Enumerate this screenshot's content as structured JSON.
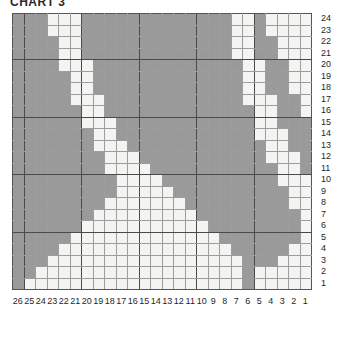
{
  "title": "CHART 3",
  "colors": {
    "filled": "#9a9a9a",
    "empty": "#f4f4f2",
    "grid_minor": "#9d9d9d",
    "grid_major": "#4a4a4a",
    "text": "#1f1f1f"
  },
  "chart_data": {
    "type": "heatmap",
    "title": "CHART 3",
    "xlabel": "",
    "ylabel": "",
    "legend": [],
    "grid": true,
    "columns": 26,
    "rows": 24,
    "column_labels": [
      26,
      25,
      24,
      23,
      22,
      21,
      20,
      19,
      18,
      17,
      16,
      15,
      14,
      13,
      12,
      11,
      10,
      9,
      8,
      7,
      6,
      5,
      4,
      3,
      2,
      1
    ],
    "row_labels": [
      24,
      23,
      22,
      21,
      20,
      19,
      18,
      17,
      16,
      15,
      14,
      13,
      12,
      11,
      10,
      9,
      8,
      7,
      6,
      5,
      4,
      3,
      2,
      1
    ],
    "value_meaning": {
      "1": "filled (contrast colour)",
      "0": "empty (background colour)"
    },
    "matrix_row_order": "top-to-bottom, row 24 first down to row 1",
    "matrix_column_order": "left-to-right, column 26 first down to column 1",
    "matrix": [
      [
        1,
        1,
        1,
        0,
        0,
        0,
        1,
        1,
        1,
        1,
        1,
        1,
        1,
        1,
        1,
        1,
        1,
        1,
        1,
        0,
        0,
        1,
        0,
        0,
        0,
        0
      ],
      [
        1,
        1,
        1,
        0,
        0,
        0,
        1,
        1,
        1,
        1,
        1,
        1,
        1,
        1,
        1,
        1,
        1,
        1,
        1,
        0,
        0,
        1,
        0,
        0,
        0,
        0
      ],
      [
        1,
        1,
        1,
        1,
        0,
        0,
        1,
        1,
        1,
        1,
        1,
        1,
        1,
        1,
        1,
        1,
        1,
        1,
        1,
        0,
        0,
        1,
        1,
        0,
        0,
        0
      ],
      [
        1,
        1,
        1,
        1,
        0,
        0,
        1,
        1,
        1,
        1,
        1,
        1,
        1,
        1,
        1,
        1,
        1,
        1,
        1,
        0,
        0,
        1,
        1,
        0,
        0,
        0
      ],
      [
        1,
        1,
        1,
        1,
        0,
        0,
        0,
        1,
        1,
        1,
        1,
        1,
        1,
        1,
        1,
        1,
        1,
        1,
        1,
        1,
        0,
        0,
        1,
        1,
        0,
        0
      ],
      [
        1,
        1,
        1,
        1,
        1,
        0,
        0,
        1,
        1,
        1,
        1,
        1,
        1,
        1,
        1,
        1,
        1,
        1,
        1,
        1,
        0,
        0,
        1,
        1,
        0,
        0
      ],
      [
        1,
        1,
        1,
        1,
        1,
        0,
        0,
        1,
        1,
        1,
        1,
        1,
        1,
        1,
        1,
        1,
        1,
        1,
        1,
        1,
        0,
        0,
        1,
        1,
        0,
        0
      ],
      [
        1,
        1,
        1,
        1,
        1,
        0,
        0,
        0,
        1,
        1,
        1,
        1,
        1,
        1,
        1,
        1,
        1,
        1,
        1,
        1,
        0,
        0,
        0,
        1,
        1,
        0
      ],
      [
        1,
        1,
        1,
        1,
        1,
        1,
        0,
        0,
        1,
        1,
        1,
        1,
        1,
        1,
        1,
        1,
        1,
        1,
        1,
        1,
        1,
        0,
        0,
        1,
        1,
        0
      ],
      [
        1,
        1,
        1,
        1,
        1,
        1,
        0,
        0,
        0,
        1,
        1,
        1,
        1,
        1,
        1,
        1,
        1,
        1,
        1,
        1,
        1,
        0,
        0,
        1,
        1,
        1
      ],
      [
        1,
        1,
        1,
        1,
        1,
        1,
        1,
        0,
        0,
        1,
        1,
        1,
        1,
        1,
        1,
        1,
        1,
        1,
        1,
        1,
        1,
        0,
        0,
        0,
        1,
        1
      ],
      [
        1,
        1,
        1,
        1,
        1,
        1,
        1,
        0,
        0,
        0,
        1,
        1,
        1,
        1,
        1,
        1,
        1,
        1,
        1,
        1,
        1,
        1,
        0,
        0,
        1,
        1
      ],
      [
        1,
        1,
        1,
        1,
        1,
        1,
        1,
        1,
        0,
        0,
        0,
        1,
        1,
        1,
        1,
        1,
        1,
        1,
        1,
        1,
        1,
        1,
        0,
        0,
        0,
        1
      ],
      [
        1,
        1,
        1,
        1,
        1,
        1,
        1,
        1,
        0,
        0,
        0,
        0,
        1,
        1,
        1,
        1,
        1,
        1,
        1,
        1,
        1,
        1,
        1,
        0,
        0,
        1
      ],
      [
        1,
        1,
        1,
        1,
        1,
        1,
        1,
        1,
        1,
        0,
        0,
        0,
        0,
        1,
        1,
        1,
        1,
        1,
        1,
        1,
        1,
        1,
        1,
        0,
        0,
        0
      ],
      [
        1,
        1,
        1,
        1,
        1,
        1,
        1,
        1,
        1,
        0,
        0,
        0,
        0,
        0,
        1,
        1,
        1,
        1,
        1,
        1,
        1,
        1,
        1,
        1,
        0,
        0
      ],
      [
        1,
        1,
        1,
        1,
        1,
        1,
        1,
        1,
        0,
        0,
        0,
        0,
        0,
        0,
        0,
        1,
        1,
        1,
        1,
        1,
        1,
        1,
        1,
        1,
        0,
        0
      ],
      [
        1,
        1,
        1,
        1,
        1,
        1,
        1,
        0,
        0,
        0,
        0,
        0,
        0,
        0,
        0,
        0,
        1,
        1,
        1,
        1,
        1,
        1,
        1,
        1,
        1,
        0
      ],
      [
        1,
        1,
        1,
        1,
        1,
        1,
        0,
        0,
        0,
        0,
        0,
        0,
        0,
        0,
        0,
        0,
        0,
        1,
        1,
        1,
        1,
        1,
        1,
        1,
        1,
        0
      ],
      [
        1,
        1,
        1,
        1,
        1,
        0,
        0,
        0,
        0,
        0,
        0,
        0,
        0,
        0,
        0,
        0,
        0,
        0,
        1,
        1,
        1,
        1,
        1,
        1,
        1,
        0
      ],
      [
        1,
        1,
        1,
        1,
        0,
        0,
        0,
        0,
        0,
        0,
        0,
        0,
        0,
        0,
        0,
        0,
        0,
        0,
        0,
        1,
        1,
        1,
        1,
        1,
        0,
        0
      ],
      [
        1,
        1,
        1,
        0,
        0,
        0,
        0,
        0,
        0,
        0,
        0,
        0,
        0,
        0,
        0,
        0,
        0,
        0,
        0,
        0,
        1,
        1,
        1,
        0,
        0,
        0
      ],
      [
        1,
        1,
        0,
        0,
        0,
        0,
        0,
        0,
        0,
        0,
        0,
        0,
        0,
        0,
        0,
        0,
        0,
        0,
        0,
        0,
        1,
        0,
        0,
        0,
        0,
        0
      ],
      [
        1,
        0,
        0,
        0,
        0,
        0,
        0,
        0,
        0,
        0,
        0,
        0,
        0,
        0,
        0,
        0,
        0,
        0,
        0,
        0,
        1,
        0,
        0,
        0,
        0,
        0
      ]
    ]
  }
}
